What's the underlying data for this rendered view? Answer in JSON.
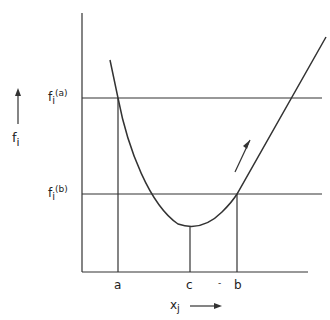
{
  "diagram": {
    "y_axis_label": "f",
    "y_axis_subscript": "i",
    "x_axis_label": "x",
    "x_axis_subscript": "j",
    "level_a": {
      "label": "f",
      "sub": "i",
      "sup": "(a)"
    },
    "level_b": {
      "label": "f",
      "sub": "i",
      "sup": "(b)"
    },
    "x_ticks": [
      "a",
      "c",
      "b"
    ],
    "stray_mark": "-"
  }
}
